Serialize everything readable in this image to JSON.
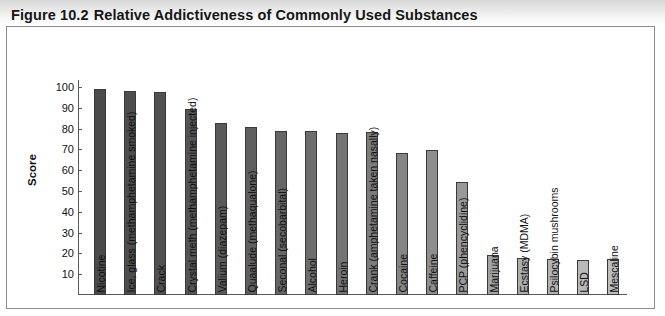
{
  "figure": {
    "number": "Figure 10.2",
    "caption": "Relative Addictiveness of Commonly Used Substances"
  },
  "chart_data": {
    "type": "bar",
    "title": "Relative Addictiveness of Commonly Used Substances",
    "xlabel": "",
    "ylabel": "Score",
    "ylim": [
      0,
      100
    ],
    "yticks": [
      10,
      20,
      30,
      40,
      50,
      60,
      70,
      80,
      90,
      100
    ],
    "grid": false,
    "legend": "none",
    "orientation": "vertical",
    "categories": [
      "Nicotine",
      "Ice, glass (methamphetamine smoked)",
      "Crack",
      "Crystal meth (methamphetamine injected)",
      "Valium (diazepam)",
      "Quaalude (methaqualone)",
      "Seconal (secobarbital)",
      "Alcohol",
      "Heroin",
      "Crank (amphetamine taken nasally)",
      "Cocaine",
      "Caffeine",
      "PCP (phencyclidine)",
      "Marijuana",
      "Ecstasy (MDMA)",
      "Psilocybin mushrooms",
      "LSD",
      "Mescaline"
    ],
    "values": [
      99,
      98,
      97.5,
      89.5,
      82.5,
      81,
      79,
      79,
      78,
      78.5,
      68.5,
      69.5,
      54.5,
      19,
      18,
      17.5,
      17,
      17.5
    ],
    "bar_colors": [
      "#4a4a4a",
      "#4d4d4d",
      "#515151",
      "#555555",
      "#5a5a5a",
      "#5f5f5f",
      "#666666",
      "#6d6d6d",
      "#747474",
      "#7c7c7c",
      "#858585",
      "#8e8e8e",
      "#999999",
      "#a3a3a3",
      "#acacac",
      "#b3b3b3",
      "#b9b9b9",
      "#bdbdbd"
    ],
    "bar_outline_color": "#3a3a3a"
  },
  "style": {
    "axis_color": "#5a5a5a",
    "frame_color": "#8d8d8d",
    "text_color": "#111111",
    "title_band_color": "#dedede",
    "background": "#ffffff"
  }
}
